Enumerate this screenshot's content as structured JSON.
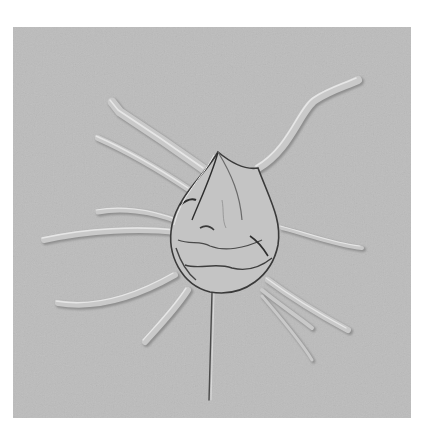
{
  "image": {
    "kind": "micrograph",
    "description": "Grayscale DIC micrograph of a spiny single-celled organism with many radiating spines on a light gray background",
    "alt": "Spiny cell micrograph",
    "colors": {
      "page_background": "#ffffff",
      "field_background": "#bcbcbc",
      "highlight": "#e6e6e6",
      "shadow": "#5a5a5a",
      "outline": "#2e2e2e"
    }
  }
}
